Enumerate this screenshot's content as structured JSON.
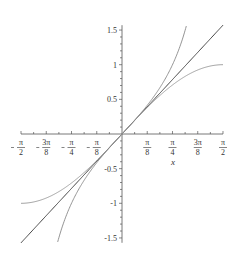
{
  "chart_data": {
    "type": "line",
    "title": "",
    "xlabel": "x",
    "ylabel": "",
    "xlim": [
      -1.5708,
      1.5708
    ],
    "ylim": [
      -1.57,
      1.57
    ],
    "grid": false,
    "legend": null,
    "x_ticks": [
      {
        "value": -1.5708,
        "label_num": "π",
        "label_den": "2",
        "neg": true
      },
      {
        "value": -1.1781,
        "label_num": "3π",
        "label_den": "8",
        "neg": true
      },
      {
        "value": -0.7854,
        "label_num": "π",
        "label_den": "4",
        "neg": true
      },
      {
        "value": -0.3927,
        "label_num": "π",
        "label_den": "8",
        "neg": true
      },
      {
        "value": 0.3927,
        "label_num": "π",
        "label_den": "8",
        "neg": false
      },
      {
        "value": 0.7854,
        "label_num": "π",
        "label_den": "4",
        "neg": false
      },
      {
        "value": 1.1781,
        "label_num": "3π",
        "label_den": "8",
        "neg": false
      },
      {
        "value": 1.5708,
        "label_num": "π",
        "label_den": "2",
        "neg": false
      }
    ],
    "y_ticks": [
      {
        "value": 1.5,
        "label": "1.5"
      },
      {
        "value": 1,
        "label": "1"
      },
      {
        "value": 0.5,
        "label": "0.5"
      },
      {
        "value": -0.5,
        "label": "-0.5"
      },
      {
        "value": -1,
        "label": "-1"
      },
      {
        "value": -1.5,
        "label": "-1.5"
      }
    ],
    "series": [
      {
        "name": "x",
        "function": "x",
        "color": "#444444",
        "x_range": [
          -1.5708,
          1.5708
        ]
      },
      {
        "name": "sin(x)",
        "function": "sin",
        "color": "#999999",
        "x_range": [
          -1.5708,
          1.5708
        ]
      },
      {
        "name": "tan(x)",
        "function": "tan",
        "color": "#888888",
        "x_range": [
          -1.0,
          1.0
        ]
      }
    ]
  },
  "axis": {
    "x_label": "x"
  }
}
